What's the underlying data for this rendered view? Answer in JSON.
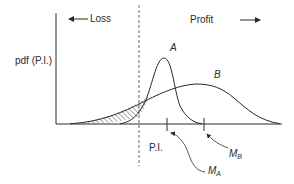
{
  "diagram": {
    "type": "probability-density-comparison",
    "y_axis_label": "pdf (P.I.)",
    "loss_label": "Loss",
    "profit_label": "Profit",
    "curves": [
      {
        "name": "A",
        "label": "A",
        "description": "narrow distribution, tall peak"
      },
      {
        "name": "B",
        "label": "B",
        "description": "wide distribution, lower peak"
      }
    ],
    "x_markers": {
      "pi": "P.I.",
      "ma_main": "M",
      "ma_sub": "A",
      "mb_main": "M",
      "mb_sub": "B"
    },
    "hatched_region": "loss-side area between curves B and A",
    "colors": {
      "line": "#2a2a2a",
      "dashed": "#555555",
      "background": "#ffffff"
    }
  }
}
